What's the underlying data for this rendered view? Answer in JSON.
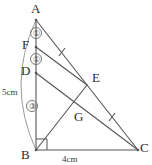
{
  "figure": {
    "kind": "geometry-diagram",
    "width": 152,
    "height": 165,
    "background_color": "#ffffff",
    "stroke_color": "#555555",
    "text_color": "#2b2b2b"
  },
  "vertices": [
    {
      "id": "A",
      "label": "A",
      "x": 36,
      "y": 20,
      "label_x": 31,
      "label_y": 2
    },
    {
      "id": "F",
      "label": "F",
      "x": 36,
      "y": 47,
      "label_x": 22,
      "label_y": 38
    },
    {
      "id": "D",
      "label": "D",
      "x": 36,
      "y": 73,
      "label_x": 21,
      "label_y": 64
    },
    {
      "id": "B",
      "label": "B",
      "x": 36,
      "y": 150,
      "label_x": 21,
      "label_y": 148
    },
    {
      "id": "C",
      "label": "C",
      "x": 138,
      "y": 150,
      "label_x": 140,
      "label_y": 141
    },
    {
      "id": "E",
      "label": "E",
      "x": 87,
      "y": 85,
      "label_x": 92,
      "label_y": 71
    },
    {
      "id": "G",
      "label": "G",
      "x": 72,
      "y": 113,
      "label_x": 74,
      "label_y": 110
    }
  ],
  "segments": [
    {
      "name": "AB",
      "from": "A",
      "to": "B"
    },
    {
      "name": "BC",
      "from": "B",
      "to": "C"
    },
    {
      "name": "AC",
      "from": "A",
      "to": "C"
    },
    {
      "name": "FE",
      "from": "F",
      "to": "E"
    },
    {
      "name": "DC",
      "from": "D",
      "to": "C"
    },
    {
      "name": "BE",
      "from": "B",
      "to": "E"
    }
  ],
  "ratio_marks": [
    {
      "id": "ratio-AF",
      "label": "①",
      "segment": "A-F",
      "x": 30,
      "y": 27
    },
    {
      "id": "ratio-FD",
      "label": "①",
      "segment": "F-D",
      "x": 30,
      "y": 53
    },
    {
      "id": "ratio-DB",
      "label": "③",
      "segment": "D-B",
      "x": 26,
      "y": 100
    }
  ],
  "measurements": [
    {
      "id": "length-AB",
      "label": "5cm",
      "x": 2,
      "y": 88,
      "applies_to": "AB"
    },
    {
      "id": "length-BC",
      "label": "4cm",
      "x": 62,
      "y": 155,
      "applies_to": "BC"
    }
  ],
  "tick_marks": [
    {
      "id": "tick-AE",
      "on": "AE",
      "x": 62,
      "y": 52
    },
    {
      "id": "tick-EC",
      "on": "EC",
      "x": 112,
      "y": 117
    }
  ],
  "right_angle": {
    "id": "right-angle-B",
    "vertex": "B",
    "size": 11
  },
  "arc": {
    "id": "arc-AB-measure",
    "from": "A",
    "to": "B",
    "bulge": 30
  }
}
